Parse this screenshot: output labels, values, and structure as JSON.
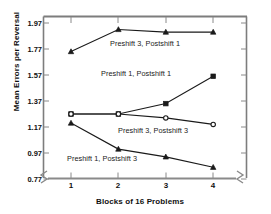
{
  "chart_data": {
    "type": "line",
    "title": "",
    "xlabel": "Blocks of 16 Problems",
    "ylabel": "Mean Errors per Reversal",
    "x": [
      1,
      2,
      3,
      4
    ],
    "xticklabels": [
      "1",
      "2",
      "3",
      "4"
    ],
    "yticklabels": [
      "1.97",
      "1.77",
      "1.57",
      "1.37",
      "1.17",
      "0.97",
      "0.77"
    ],
    "yticks": [
      1.97,
      1.77,
      1.57,
      1.37,
      1.17,
      0.97,
      0.77
    ],
    "ylim": [
      0.71,
      2.03
    ],
    "xlim": [
      0.62,
      4.42
    ],
    "grid": false,
    "legend": "inline-annotations",
    "axis_break_marks": true,
    "series": [
      {
        "name": "Preshift 3, Postshift 1",
        "marker": "triangle",
        "marker_filled": true,
        "values": [
          1.75,
          1.92,
          1.9,
          1.9
        ],
        "label_x": 110,
        "label_y": 39
      },
      {
        "name": "Preshift 1, Postshift 1",
        "marker": "square",
        "marker_filled": true,
        "values": [
          1.27,
          1.27,
          1.35,
          1.56
        ],
        "label_x": 101,
        "label_y": 69
      },
      {
        "name": "Preshift 3, Postshift 3",
        "marker": "circle",
        "marker_filled": false,
        "values": [
          1.27,
          1.27,
          1.24,
          1.19
        ],
        "label_x": 118,
        "label_y": 126
      },
      {
        "name": "Preshift 1, Postshift 3",
        "marker": "triangle",
        "marker_filled": true,
        "values": [
          1.2,
          1.0,
          0.94,
          0.86
        ],
        "label_x": 67,
        "label_y": 154
      }
    ]
  },
  "colors": {
    "axis": "#7d7d7d",
    "line": "#1a1a1a",
    "text": "#101010",
    "background": "#ffffff"
  }
}
